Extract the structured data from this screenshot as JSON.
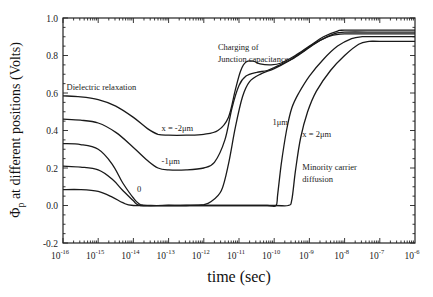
{
  "chart_data": {
    "type": "line",
    "title": "",
    "xlabel": "time (sec)",
    "ylabel": "Φp at different positions (Volts)",
    "xscale": "log",
    "xlim": [
      1e-16,
      1e-06
    ],
    "ylim": [
      -0.2,
      1.0
    ],
    "grid": false,
    "x_tick_exponents": [
      -16,
      -15,
      -14,
      -13,
      -12,
      -11,
      -10,
      -9,
      -8,
      -7,
      -6
    ],
    "y_ticks": [
      "-0.2",
      "0.0",
      "0.2",
      "0.4",
      "0.6",
      "0.8",
      "1.0"
    ],
    "series": [
      {
        "name": "x = -2μm",
        "points_log10t_V": [
          [
            -16,
            0.585
          ],
          [
            -15.5,
            0.58
          ],
          [
            -15,
            0.565
          ],
          [
            -14.5,
            0.53
          ],
          [
            -14,
            0.47
          ],
          [
            -13.6,
            0.41
          ],
          [
            -13.3,
            0.38
          ],
          [
            -13,
            0.375
          ],
          [
            -12.5,
            0.375
          ],
          [
            -12,
            0.38
          ],
          [
            -11.6,
            0.4
          ],
          [
            -11.3,
            0.47
          ],
          [
            -11.1,
            0.62
          ],
          [
            -10.95,
            0.72
          ],
          [
            -10.8,
            0.765
          ],
          [
            -10.6,
            0.77
          ],
          [
            -10.4,
            0.755
          ],
          [
            -10.1,
            0.75
          ],
          [
            -9.8,
            0.76
          ],
          [
            -9.4,
            0.8
          ],
          [
            -9,
            0.85
          ],
          [
            -8.6,
            0.9
          ],
          [
            -8.2,
            0.93
          ],
          [
            -8,
            0.935
          ],
          [
            -7,
            0.935
          ],
          [
            -6,
            0.935
          ]
        ]
      },
      {
        "name": "-1μm",
        "points_log10t_V": [
          [
            -16,
            0.46
          ],
          [
            -15.5,
            0.455
          ],
          [
            -15,
            0.44
          ],
          [
            -14.5,
            0.39
          ],
          [
            -14,
            0.31
          ],
          [
            -13.6,
            0.24
          ],
          [
            -13.3,
            0.2
          ],
          [
            -13,
            0.19
          ],
          [
            -12.5,
            0.19
          ],
          [
            -12,
            0.2
          ],
          [
            -11.7,
            0.23
          ],
          [
            -11.4,
            0.35
          ],
          [
            -11.2,
            0.52
          ],
          [
            -11,
            0.64
          ],
          [
            -10.8,
            0.69
          ],
          [
            -10.5,
            0.71
          ],
          [
            -10.2,
            0.72
          ],
          [
            -9.9,
            0.745
          ],
          [
            -9.5,
            0.78
          ],
          [
            -9.1,
            0.83
          ],
          [
            -8.7,
            0.88
          ],
          [
            -8.3,
            0.915
          ],
          [
            -8,
            0.925
          ],
          [
            -7,
            0.925
          ],
          [
            -6,
            0.925
          ]
        ]
      },
      {
        "name": "0",
        "points_log10t_V": [
          [
            -16,
            0.33
          ],
          [
            -15.5,
            0.325
          ],
          [
            -15,
            0.3
          ],
          [
            -14.6,
            0.22
          ],
          [
            -14.3,
            0.12
          ],
          [
            -14,
            0.04
          ],
          [
            -13.8,
            0.005
          ],
          [
            -13.5,
            0.0
          ],
          [
            -13,
            0.0
          ],
          [
            -12.5,
            0.0
          ],
          [
            -12,
            0.005
          ],
          [
            -11.8,
            0.02
          ],
          [
            -11.5,
            0.08
          ],
          [
            -11.3,
            0.22
          ],
          [
            -11.1,
            0.42
          ],
          [
            -10.9,
            0.58
          ],
          [
            -10.7,
            0.66
          ],
          [
            -10.4,
            0.7
          ],
          [
            -10,
            0.73
          ],
          [
            -9.6,
            0.77
          ],
          [
            -9.2,
            0.82
          ],
          [
            -8.8,
            0.87
          ],
          [
            -8.4,
            0.905
          ],
          [
            -8,
            0.915
          ],
          [
            -7,
            0.915
          ],
          [
            -6,
            0.915
          ]
        ]
      },
      {
        "name": "1μm",
        "points_log10t_V": [
          [
            -16,
            0.21
          ],
          [
            -15.5,
            0.205
          ],
          [
            -15,
            0.19
          ],
          [
            -14.6,
            0.14
          ],
          [
            -14.3,
            0.08
          ],
          [
            -14,
            0.025
          ],
          [
            -13.8,
            0.0
          ],
          [
            -13,
            0.0
          ],
          [
            -12,
            0.0
          ],
          [
            -11,
            0.0
          ],
          [
            -10.2,
            0.0
          ],
          [
            -9.95,
            0.0
          ],
          [
            -9.9,
            0.06
          ],
          [
            -9.8,
            0.22
          ],
          [
            -9.65,
            0.4
          ],
          [
            -9.5,
            0.52
          ],
          [
            -9.3,
            0.6
          ],
          [
            -9,
            0.69
          ],
          [
            -8.6,
            0.78
          ],
          [
            -8.2,
            0.85
          ],
          [
            -7.8,
            0.89
          ],
          [
            -7.5,
            0.9
          ],
          [
            -7,
            0.9
          ],
          [
            -6,
            0.9
          ]
        ]
      },
      {
        "name": "x = 2μm",
        "points_log10t_V": [
          [
            -16,
            0.085
          ],
          [
            -15.5,
            0.085
          ],
          [
            -15,
            0.075
          ],
          [
            -14.6,
            0.045
          ],
          [
            -14.3,
            0.015
          ],
          [
            -14,
            0.0
          ],
          [
            -13,
            0.0
          ],
          [
            -12,
            0.0
          ],
          [
            -11,
            0.0
          ],
          [
            -10,
            0.0
          ],
          [
            -9.6,
            0.0
          ],
          [
            -9.5,
            0.03
          ],
          [
            -9.4,
            0.18
          ],
          [
            -9.25,
            0.36
          ],
          [
            -9.05,
            0.5
          ],
          [
            -8.8,
            0.61
          ],
          [
            -8.4,
            0.72
          ],
          [
            -8,
            0.8
          ],
          [
            -7.6,
            0.86
          ],
          [
            -7.3,
            0.875
          ],
          [
            -7,
            0.875
          ],
          [
            -6,
            0.875
          ]
        ]
      }
    ],
    "annotations": [
      {
        "text": "Dielectric relaxation",
        "log10t": -15.9,
        "V": 0.615
      },
      {
        "text": "x = -2μm",
        "log10t": -13.2,
        "V": 0.4
      },
      {
        "text": "-1μm",
        "log10t": -13.2,
        "V": 0.22
      },
      {
        "text": "0",
        "log10t": -13.9,
        "V": 0.07
      },
      {
        "text": "Charging of",
        "log10t": -11.6,
        "V": 0.83
      },
      {
        "text": "Junction capacitance",
        "log10t": -11.6,
        "V": 0.765
      },
      {
        "text": "1μm",
        "log10t": -10.05,
        "V": 0.43
      },
      {
        "text": "x = 2μm",
        "log10t": -9.2,
        "V": 0.365
      },
      {
        "text": "Minority carrier",
        "log10t": -9.2,
        "V": 0.19
      },
      {
        "text": "diffusion",
        "log10t": -9.2,
        "V": 0.125
      }
    ]
  },
  "axes": {
    "x_title": "time (sec)",
    "y_title_symbol": "Φ",
    "y_title_sub": "p",
    "y_title_rest": " at different positions (Volts)",
    "x_tick_base": "10"
  }
}
